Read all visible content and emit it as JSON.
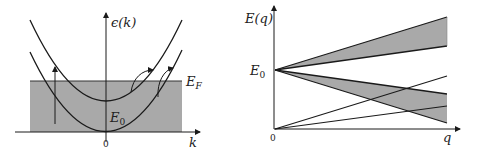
{
  "left_panel": {
    "y_axis_label": "ϵ(k)",
    "x_axis_label": "k",
    "origin_label": "0",
    "fermi_label": "E",
    "fermi_sub": "F",
    "e0_label": "E",
    "e0_sub": "0",
    "fill_color": "#a9a9a9",
    "line_color": "#1a1a1a"
  },
  "right_panel": {
    "y_axis_label": "E(q)",
    "x_axis_label": "q",
    "origin_label": "0",
    "e0_label": "E",
    "e0_sub": "0",
    "fill_color": "#a9a9a9",
    "line_color": "#1a1a1a"
  }
}
